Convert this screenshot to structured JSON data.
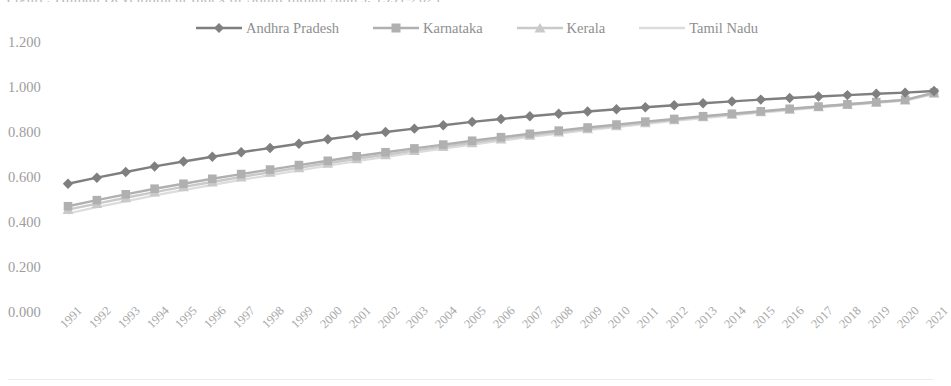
{
  "chart_data": {
    "type": "line",
    "title": "Figure: Human Development Index of South Indian States, 1991-2021",
    "xlabel": "",
    "ylabel": "",
    "ylim": [
      0.0,
      1.2
    ],
    "ytick_labels": [
      "0.000",
      "0.200",
      "0.400",
      "0.600",
      "0.800",
      "1.000",
      "1.200"
    ],
    "ytick_values": [
      0.0,
      0.2,
      0.4,
      0.6,
      0.8,
      1.0,
      1.2
    ],
    "grid": false,
    "legend_position": "top",
    "categories": [
      "1991",
      "1992",
      "1993",
      "1994",
      "1995",
      "1996",
      "1997",
      "1998",
      "1999",
      "2000",
      "2001",
      "2002",
      "2003",
      "2004",
      "2005",
      "2006",
      "2007",
      "2008",
      "2009",
      "2010",
      "2011",
      "2012",
      "2013",
      "2014",
      "2015",
      "2016",
      "2017",
      "2018",
      "2019",
      "2020",
      "2021"
    ],
    "series": [
      {
        "name": "Andhra Pradesh",
        "color": "#7f7f7f",
        "marker": "diamond",
        "values": [
          0.57,
          0.597,
          0.622,
          0.647,
          0.669,
          0.69,
          0.71,
          0.729,
          0.748,
          0.768,
          0.785,
          0.8,
          0.815,
          0.83,
          0.845,
          0.858,
          0.87,
          0.881,
          0.891,
          0.901,
          0.91,
          0.919,
          0.928,
          0.936,
          0.944,
          0.951,
          0.958,
          0.964,
          0.97,
          0.975,
          0.982
        ]
      },
      {
        "name": "Karnataka",
        "color": "#b0b0b0",
        "marker": "square",
        "values": [
          0.47,
          0.497,
          0.523,
          0.548,
          0.57,
          0.592,
          0.613,
          0.633,
          0.653,
          0.672,
          0.692,
          0.71,
          0.727,
          0.744,
          0.761,
          0.777,
          0.792,
          0.806,
          0.82,
          0.833,
          0.846,
          0.858,
          0.87,
          0.881,
          0.892,
          0.903,
          0.913,
          0.923,
          0.933,
          0.943,
          0.975
        ]
      },
      {
        "name": "Kerala",
        "color": "#c9c9c9",
        "marker": "triangle",
        "values": [
          0.455,
          0.482,
          0.508,
          0.533,
          0.556,
          0.578,
          0.6,
          0.621,
          0.641,
          0.661,
          0.681,
          0.699,
          0.717,
          0.735,
          0.752,
          0.769,
          0.785,
          0.8,
          0.814,
          0.828,
          0.841,
          0.854,
          0.867,
          0.879,
          0.89,
          0.901,
          0.912,
          0.922,
          0.932,
          0.942,
          0.972
        ]
      },
      {
        "name": "Tamil Nadu",
        "color": "#dcdcdc",
        "marker": "none",
        "values": [
          0.438,
          0.466,
          0.492,
          0.518,
          0.542,
          0.565,
          0.587,
          0.608,
          0.629,
          0.65,
          0.67,
          0.689,
          0.708,
          0.726,
          0.744,
          0.761,
          0.778,
          0.793,
          0.808,
          0.822,
          0.836,
          0.849,
          0.862,
          0.874,
          0.886,
          0.897,
          0.908,
          0.919,
          0.929,
          0.939,
          0.968
        ]
      }
    ]
  },
  "colors": {
    "andhra_pradesh": "#7f7f7f",
    "karnataka": "#b0b0b0",
    "kerala": "#c9c9c9",
    "tamil_nadu": "#dcdcdc",
    "axis_text": "#9d9d9d",
    "background": "#ffffff"
  }
}
